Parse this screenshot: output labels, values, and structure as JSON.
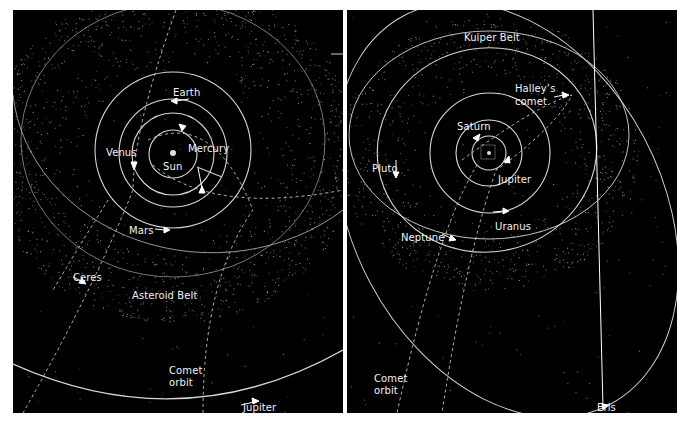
{
  "figure": {
    "panels": [
      {
        "id": "inner-solar-system",
        "labels": {
          "earth": "Earth",
          "venus": "Venus",
          "mercury": "Mercury",
          "sun": "Sun",
          "mars": "Mars",
          "ceres": "Ceres",
          "asteroid_belt": "Asteroid Belt",
          "comet_orbit_line1": "Comet",
          "comet_orbit_line2": "orbit",
          "jupiter": "Jupiter"
        }
      },
      {
        "id": "outer-solar-system",
        "labels": {
          "kuiper_belt": "Kuiper Belt",
          "halleys_line1": "Halley’s",
          "halleys_line2": "comet",
          "saturn": "Saturn",
          "pluto": "Pluto",
          "jupiter": "Jupiter",
          "uranus": "Uranus",
          "neptune": "Neptune",
          "comet_orbit_line1": "Comet",
          "comet_orbit_line2": "orbit",
          "eris": "Eris"
        }
      }
    ],
    "colors": {
      "background": "#000000",
      "orbit": "#d8d8d8",
      "text": "#f2f2f2",
      "page": "#ffffff"
    }
  }
}
